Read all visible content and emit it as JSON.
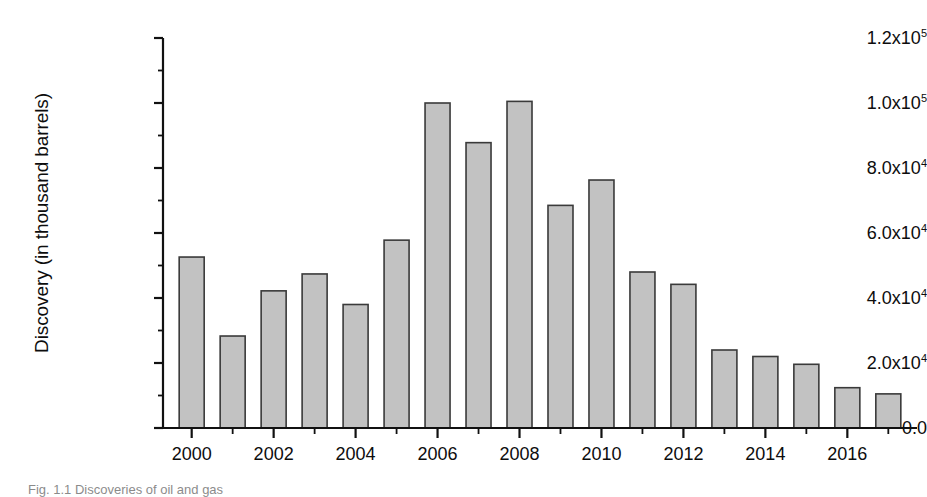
{
  "chart_data": {
    "type": "bar",
    "title": "",
    "xlabel": "",
    "ylabel": "Discovery (in thousand barrels)",
    "categories": [
      2000,
      2001,
      2002,
      2003,
      2004,
      2005,
      2006,
      2007,
      2008,
      2009,
      2010,
      2011,
      2012,
      2013,
      2014,
      2015,
      2016,
      2017
    ],
    "values": [
      52600,
      28300,
      42200,
      47400,
      38000,
      57800,
      100000,
      87800,
      100500,
      68500,
      76300,
      48000,
      44200,
      24000,
      22000,
      19600,
      12400,
      10500
    ],
    "ylim": [
      0,
      120000
    ],
    "xlim": [
      1999.3,
      2017.7
    ],
    "grid": false,
    "legend": null,
    "y_tick_values": [
      0,
      20000,
      40000,
      60000,
      80000,
      100000,
      120000
    ],
    "y_tick_labels": [
      "0.0",
      "2.0x10⁴",
      "4.0x10⁴",
      "6.0x10⁴",
      "8.0x10⁴",
      "1.0x10⁵",
      "1.2x10⁵"
    ],
    "y_tick_mantissas": [
      "0.0",
      "2.0x10",
      "4.0x10",
      "6.0x10",
      "8.0x10",
      "1.0x10",
      "1.2x10"
    ],
    "y_tick_exponents": [
      "",
      "4",
      "4",
      "4",
      "4",
      "5",
      "5"
    ],
    "y_minor_tick_values": [
      10000,
      30000,
      50000,
      70000,
      90000,
      110000
    ],
    "x_tick_labels": [
      "2000",
      "2002",
      "2004",
      "2006",
      "2008",
      "2010",
      "2012",
      "2014",
      "2016"
    ],
    "x_tick_values": [
      2000,
      2002,
      2004,
      2006,
      2008,
      2010,
      2012,
      2014,
      2016
    ],
    "x_minor_tick_values": [
      2001,
      2003,
      2005,
      2007,
      2009,
      2011,
      2013,
      2015,
      2017
    ],
    "bar_fill_color": "#c2c2c2",
    "bar_edge_color": "#3a3a3a",
    "axis_color": "#111111",
    "background_color": "#ffffff"
  },
  "caption": {
    "text": "Fig. 1.1  Discoveries of oil and gas"
  }
}
